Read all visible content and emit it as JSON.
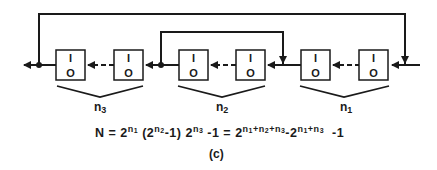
{
  "diagram": {
    "type": "shift-register feedback chain",
    "cells": [
      {
        "top": "I",
        "bottom": "O"
      },
      {
        "top": "I",
        "bottom": "O"
      },
      {
        "top": "I",
        "bottom": "O"
      },
      {
        "top": "I",
        "bottom": "O"
      },
      {
        "top": "I",
        "bottom": "O"
      },
      {
        "top": "I",
        "bottom": "O"
      }
    ],
    "groups": [
      {
        "label": "n",
        "sub": "3"
      },
      {
        "label": "n",
        "sub": "2"
      },
      {
        "label": "n",
        "sub": "1"
      }
    ],
    "formula": {
      "lhs": "N =",
      "part1_base": "2",
      "part1_exp": "n",
      "part1_exp_sub": "1",
      "part2_open": "(2",
      "part2_exp": "n",
      "part2_exp_sub": "2",
      "part2_close": "-1) 2",
      "part3_exp": "n",
      "part3_exp_sub": "3",
      "part3_tail": "-1  =  2",
      "rhs_exp1": "n",
      "rhs_exp1_sub": "1",
      "rhs_exp2": "+n",
      "rhs_exp2_sub": "2",
      "rhs_exp3": "+n",
      "rhs_exp3_sub": "3",
      "rhs_mid": "-2",
      "rhs_exp4": "n",
      "rhs_exp4_sub": "1",
      "rhs_exp5": "+n",
      "rhs_exp5_sub": "3",
      "rhs_tail": "  -1"
    },
    "caption": "(c)"
  }
}
